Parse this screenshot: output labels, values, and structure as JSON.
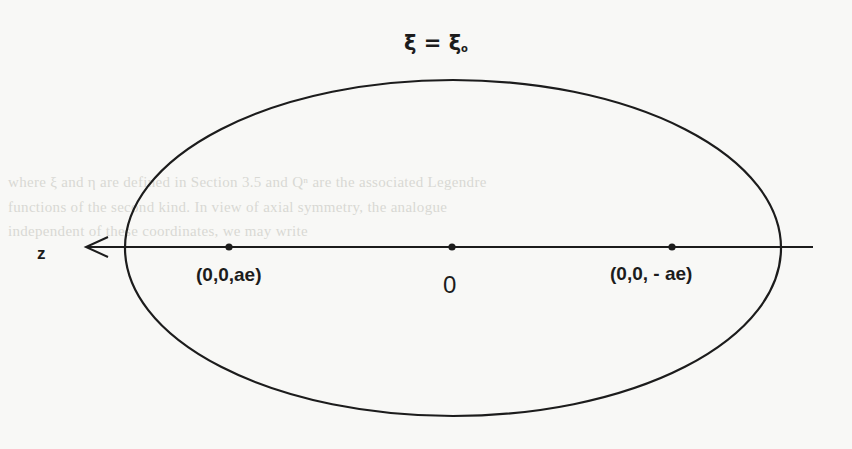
{
  "figure": {
    "title": {
      "symbol": "ξ",
      "equals": " = ",
      "rhs_symbol": "ξ",
      "rhs_subscript": "o"
    },
    "axis": {
      "label": "z",
      "direction": "left"
    },
    "points": [
      {
        "label": "(0,0,ae)",
        "role": "focus-positive"
      },
      {
        "label": "0",
        "role": "origin"
      },
      {
        "label": "(0,0, - ae)",
        "role": "focus-negative"
      }
    ],
    "shape": "ellipse",
    "colors": {
      "ink": "#1c1c1c",
      "paper": "#f8f8f6"
    }
  },
  "background_text": {
    "lines": [
      "",
      "where ξ and η are defined in Section 3.5 and Qⁿ are the associated Legendre",
      "functions of the second kind. In view of axial symmetry, the analogue",
      "independent of these coordinates, we may write"
    ]
  }
}
